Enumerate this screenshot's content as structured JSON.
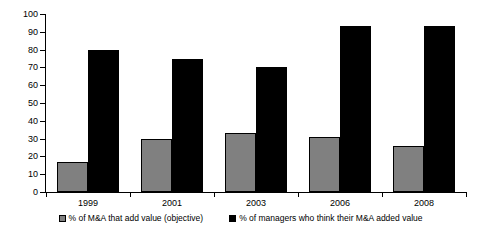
{
  "chart_data": {
    "type": "bar",
    "title": "",
    "subtitle": "",
    "xlabel": "",
    "ylabel": "",
    "categories": [
      "1999",
      "2001",
      "2003",
      "2006",
      "2008"
    ],
    "series": [
      {
        "name": "% of M&A that add value (objective)",
        "color": "#808080",
        "values": [
          17,
          30,
          33,
          31,
          26
        ]
      },
      {
        "name": "% of managers who think their M&A added value",
        "color": "#000000",
        "values": [
          80,
          75,
          70,
          93,
          93
        ]
      }
    ],
    "ylim": [
      0,
      100
    ],
    "ytick_step": 10,
    "yticks": [
      "0",
      "10",
      "20",
      "30",
      "40",
      "50",
      "60",
      "70",
      "80",
      "90",
      "100"
    ],
    "grid": false,
    "legend_position": "bottom"
  },
  "legend": {
    "items": [
      {
        "label": "% of M&A that add value (objective)",
        "swatch": "gray"
      },
      {
        "label": "% of managers who think their M&A added value",
        "swatch": "black"
      }
    ]
  }
}
